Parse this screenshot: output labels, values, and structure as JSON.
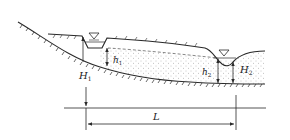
{
  "diagram": {
    "type": "groundwater-flow-between-two-channels",
    "colors": {
      "line": "#2a2a2a",
      "stipple": "#8a8a8a",
      "background": "#ffffff"
    },
    "labels": {
      "H1": {
        "main": "H",
        "sub": "1"
      },
      "h1": {
        "main": "h",
        "sub": "1"
      },
      "h2": {
        "main": "h",
        "sub": "2"
      },
      "H2": {
        "main": "H",
        "sub": "2"
      },
      "L": {
        "main": "L"
      }
    },
    "symbols": {
      "water_level_1": "water-level-triangle",
      "water_level_2": "water-level-triangle"
    }
  }
}
